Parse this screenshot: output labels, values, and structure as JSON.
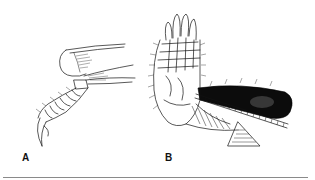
{
  "figure": {
    "panels": [
      {
        "label": "A",
        "subject": "segmented limb with claw",
        "icon": "arthropod-leg-drawing"
      },
      {
        "label": "B",
        "subject": "hand-like limb with dark lobe, beaded rod and fan",
        "icon": "hand-limb-drawing"
      }
    ],
    "colors": {
      "ink": "#111111",
      "background": "#ffffff",
      "rule": "#8a8a8a"
    }
  }
}
